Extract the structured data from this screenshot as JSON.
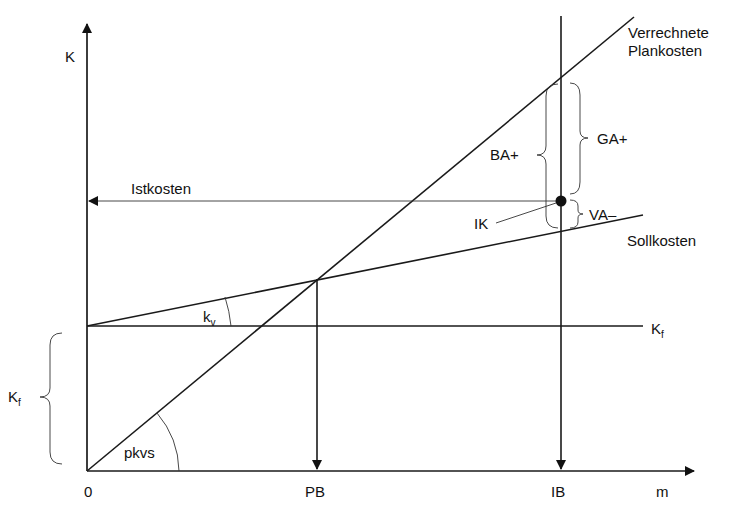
{
  "diagram": {
    "axes": {
      "y_label": "K",
      "x_label": "m",
      "origin_label": "0"
    },
    "x_ticks": {
      "pb": "PB",
      "ib": "IB"
    },
    "lines": {
      "verrechnete_1": "Verrechnete",
      "verrechnete_2": "Plankosten",
      "sollkosten": "Sollkosten",
      "kf_main": "K",
      "kf_sub": "f",
      "istkosten": "Istkosten"
    },
    "angles": {
      "kv_main": "k",
      "kv_sub": "v",
      "pkvs": "pkvs"
    },
    "braces": {
      "kf_main": "K",
      "kf_sub": "f",
      "ga": "GA+",
      "ba": "BA+",
      "va": "VA–"
    },
    "point": {
      "ik": "IK"
    }
  }
}
